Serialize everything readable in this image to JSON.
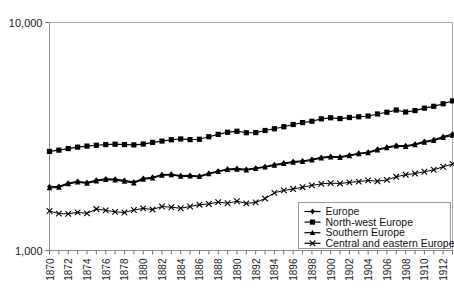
{
  "chart_data": {
    "type": "line",
    "title": "",
    "xlabel": "",
    "ylabel": "",
    "yscale": "log",
    "ylim": [
      1000,
      10000
    ],
    "ytick_labels": [
      "10,000",
      "1,000"
    ],
    "grid": false,
    "legend_position": "bottom-right",
    "xlim": [
      1870,
      1913
    ],
    "x_tick_step": 1,
    "x_label_step": 2,
    "x": [
      1870,
      1871,
      1872,
      1873,
      1874,
      1875,
      1876,
      1877,
      1878,
      1879,
      1880,
      1881,
      1882,
      1883,
      1884,
      1885,
      1886,
      1887,
      1888,
      1889,
      1890,
      1891,
      1892,
      1893,
      1894,
      1895,
      1896,
      1897,
      1898,
      1899,
      1900,
      1901,
      1902,
      1903,
      1904,
      1905,
      1906,
      1907,
      1908,
      1909,
      1910,
      1911,
      1912,
      1913
    ],
    "x_tick_labels": [
      "1870",
      "1872",
      "1874",
      "1876",
      "1878",
      "1880",
      "1882",
      "1884",
      "1886",
      "1888",
      "1890",
      "1892",
      "1894",
      "1896",
      "1898",
      "1900",
      "1902",
      "1904",
      "1906",
      "1908",
      "1910",
      "1912"
    ],
    "series": [
      {
        "name": "Europe",
        "marker": "diamond",
        "values": [
          1908,
          1912,
          1975,
          2010,
          1985,
          2035,
          2060,
          2055,
          2030,
          1995,
          2070,
          2095,
          2150,
          2160,
          2130,
          2135,
          2120,
          2180,
          2230,
          2275,
          2290,
          2270,
          2300,
          2335,
          2380,
          2420,
          2455,
          2470,
          2510,
          2560,
          2585,
          2575,
          2620,
          2670,
          2700,
          2780,
          2840,
          2890,
          2880,
          2930,
          3010,
          3060,
          3160,
          3240
        ]
      },
      {
        "name": "North-west Europe",
        "marker": "square",
        "values": [
          2720,
          2755,
          2800,
          2840,
          2870,
          2895,
          2915,
          2925,
          2915,
          2905,
          2930,
          2980,
          3020,
          3060,
          3085,
          3065,
          3075,
          3155,
          3230,
          3300,
          3335,
          3285,
          3290,
          3360,
          3420,
          3490,
          3570,
          3640,
          3690,
          3780,
          3820,
          3790,
          3830,
          3860,
          3890,
          3970,
          4040,
          4130,
          4050,
          4110,
          4210,
          4290,
          4400,
          4530
        ]
      },
      {
        "name": "Southern Europe",
        "marker": "triangle",
        "values": [
          1880,
          1890,
          1960,
          1995,
          1970,
          2015,
          2045,
          2035,
          2010,
          1975,
          2050,
          2075,
          2135,
          2145,
          2115,
          2120,
          2105,
          2165,
          2215,
          2260,
          2270,
          2250,
          2285,
          2320,
          2360,
          2400,
          2435,
          2450,
          2490,
          2540,
          2565,
          2555,
          2600,
          2650,
          2680,
          2755,
          2815,
          2865,
          2855,
          2905,
          2980,
          3030,
          3125,
          3195
        ]
      },
      {
        "name": "Central and eastern Europe",
        "marker": "cross",
        "values": [
          1490,
          1452,
          1448,
          1470,
          1455,
          1520,
          1500,
          1478,
          1468,
          1505,
          1530,
          1512,
          1560,
          1548,
          1532,
          1560,
          1588,
          1600,
          1630,
          1612,
          1645,
          1610,
          1625,
          1690,
          1790,
          1835,
          1860,
          1895,
          1930,
          1960,
          1975,
          1968,
          1990,
          2005,
          2030,
          2012,
          2040,
          2105,
          2150,
          2175,
          2215,
          2260,
          2330,
          2395
        ]
      }
    ]
  },
  "legend": {
    "items": [
      {
        "label": "Europe",
        "marker": "diamond"
      },
      {
        "label": "North-west Europe",
        "marker": "square"
      },
      {
        "label": "Southern Europe",
        "marker": "triangle"
      },
      {
        "label": "Central and eastern Europe",
        "marker": "cross"
      }
    ]
  }
}
